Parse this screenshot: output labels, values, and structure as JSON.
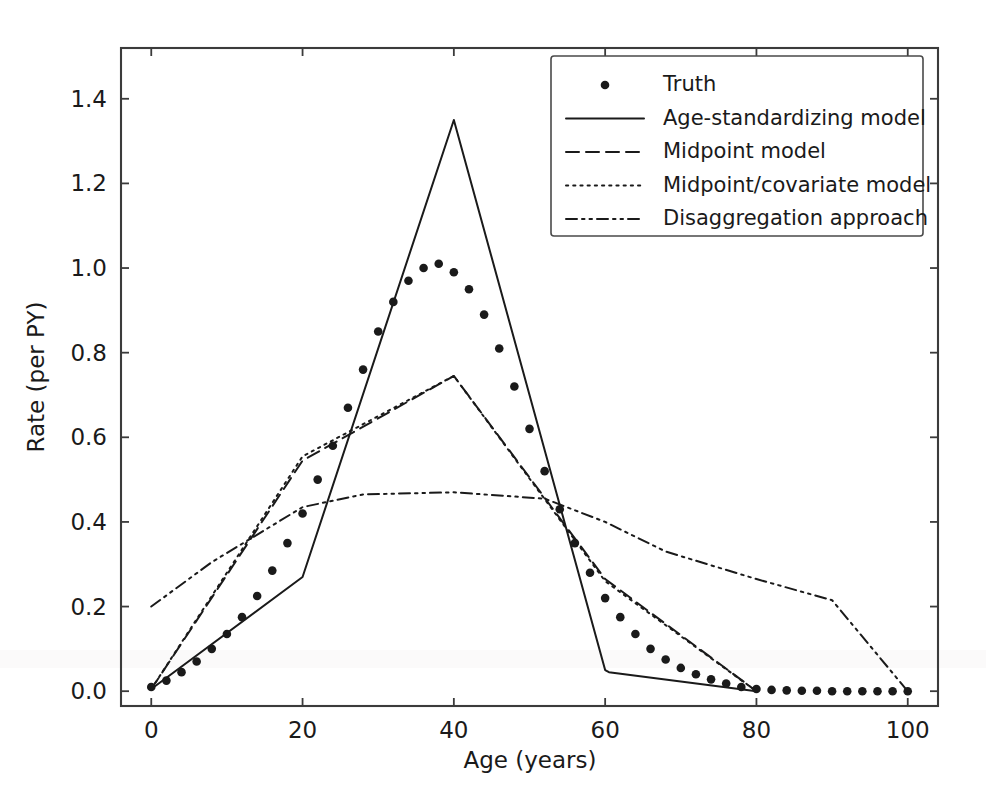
{
  "figure": {
    "background_color": "#ffffff",
    "line_color": "#1a1a1a",
    "axis_color": "#3b3b3b"
  },
  "chart_data": {
    "type": "line",
    "title": "",
    "xlabel": "Age (years)",
    "ylabel": "Rate (per PY)",
    "xlim": [
      -4,
      104
    ],
    "ylim": [
      -0.035,
      1.52
    ],
    "xticks": [
      0,
      20,
      40,
      60,
      80,
      100
    ],
    "xticklabels": [
      "0",
      "20",
      "40",
      "60",
      "80",
      "100"
    ],
    "yticks": [
      0.0,
      0.2,
      0.4,
      0.6,
      0.8,
      1.0,
      1.2,
      1.4
    ],
    "yticklabels": [
      "0.0",
      "0.2",
      "0.4",
      "0.6",
      "0.8",
      "1.0",
      "1.2",
      "1.4"
    ],
    "grid": false,
    "legend_position": "upper right",
    "series": [
      {
        "name": "Truth",
        "style": "dotted-markers",
        "marker": "point",
        "x": [
          0,
          2,
          4,
          6,
          8,
          10,
          12,
          14,
          16,
          18,
          20,
          22,
          24,
          26,
          28,
          30,
          32,
          34,
          36,
          38,
          40,
          42,
          44,
          46,
          48,
          50,
          52,
          54,
          56,
          58,
          60,
          62,
          64,
          66,
          68,
          70,
          72,
          74,
          76,
          78,
          80,
          82,
          84,
          86,
          88,
          90,
          92,
          94,
          96,
          98,
          100
        ],
        "y": [
          0.01,
          0.025,
          0.045,
          0.07,
          0.1,
          0.135,
          0.175,
          0.225,
          0.285,
          0.35,
          0.42,
          0.5,
          0.58,
          0.67,
          0.76,
          0.85,
          0.92,
          0.97,
          1.0,
          1.01,
          0.99,
          0.95,
          0.89,
          0.81,
          0.72,
          0.62,
          0.52,
          0.43,
          0.35,
          0.28,
          0.22,
          0.175,
          0.135,
          0.1,
          0.075,
          0.055,
          0.04,
          0.028,
          0.018,
          0.01,
          0.005,
          0.003,
          0.002,
          0.001,
          0.001,
          0.0,
          0.0,
          0.0,
          0.0,
          0.0,
          0.0
        ]
      },
      {
        "name": "Age-standardizing model",
        "style": "solid",
        "x": [
          0,
          20,
          40,
          60,
          60.5,
          80
        ],
        "y": [
          0.005,
          0.27,
          1.35,
          0.05,
          0.045,
          0.0
        ]
      },
      {
        "name": "Midpoint model",
        "style": "dashed",
        "x": [
          0,
          20,
          40,
          60,
          80
        ],
        "y": [
          0.005,
          0.545,
          0.745,
          0.265,
          0.0
        ]
      },
      {
        "name": "Midpoint/covariate model",
        "style": "dotted",
        "x": [
          0,
          20,
          40,
          60,
          80
        ],
        "y": [
          0.005,
          0.555,
          0.745,
          0.26,
          0.0
        ]
      },
      {
        "name": "Disaggregation approach",
        "style": "dashdotdot",
        "x": [
          0,
          8,
          20,
          28,
          40,
          52,
          60,
          68,
          80,
          90,
          100
        ],
        "y": [
          0.2,
          0.305,
          0.435,
          0.465,
          0.47,
          0.455,
          0.4,
          0.33,
          0.265,
          0.215,
          0.0
        ]
      }
    ]
  },
  "legend": {
    "entries": [
      {
        "label": "Truth",
        "style": "marker"
      },
      {
        "label": "Age-standardizing model",
        "style": "solid"
      },
      {
        "label": "Midpoint model",
        "style": "dashed"
      },
      {
        "label": "Midpoint/covariate model",
        "style": "dotted"
      },
      {
        "label": "Disaggregation approach",
        "style": "dashdotdot"
      }
    ]
  }
}
